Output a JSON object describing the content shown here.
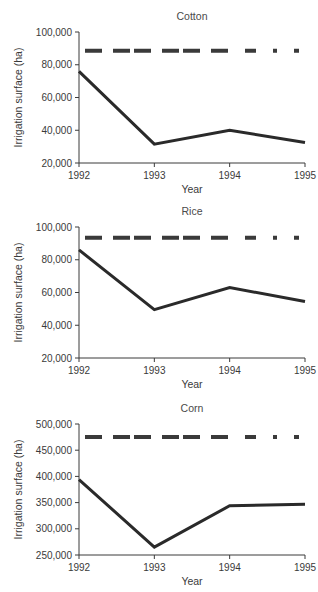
{
  "figure": {
    "background": "#ffffff",
    "line_color": "#2a2a2a",
    "ref_line_color": "#3a3a3a",
    "axis_color": "#3b3b3b"
  },
  "chart_data": [
    {
      "type": "line",
      "title": "Cotton",
      "xlabel": "Year",
      "ylabel": "Irrigation surface (ha)",
      "x": [
        1992,
        1993,
        1994,
        1995
      ],
      "xticklabels": [
        "1992",
        "1993",
        "1994",
        "1995"
      ],
      "xlim": [
        1992,
        1995
      ],
      "values": [
        76000,
        31500,
        40000,
        32500
      ],
      "yticks": [
        20000,
        40000,
        60000,
        80000,
        100000
      ],
      "yticklabels": [
        "20,000",
        "40,000",
        "60,000",
        "80,000",
        "100,000"
      ],
      "ylim": [
        20000,
        100000
      ],
      "grid": false,
      "legend": "none",
      "annotations": [
        {
          "name": "reference-dashed-line",
          "style": "dashed",
          "value": 88500,
          "span": [
            1992,
            1995
          ]
        }
      ]
    },
    {
      "type": "line",
      "title": "Rice",
      "xlabel": "Year",
      "ylabel": "Irrigation surface (ha)",
      "x": [
        1992,
        1993,
        1994,
        1995
      ],
      "xticklabels": [
        "1992",
        "1993",
        "1994",
        "1995"
      ],
      "xlim": [
        1992,
        1995
      ],
      "values": [
        86000,
        49500,
        63000,
        54500
      ],
      "yticks": [
        20000,
        40000,
        60000,
        80000,
        100000
      ],
      "yticklabels": [
        "20,000",
        "40,000",
        "60,000",
        "80,000",
        "100,000"
      ],
      "ylim": [
        20000,
        100000
      ],
      "grid": false,
      "legend": "none",
      "annotations": [
        {
          "name": "reference-dashed-line",
          "style": "dashed",
          "value": 93500,
          "span": [
            1992,
            1995
          ]
        }
      ]
    },
    {
      "type": "line",
      "title": "Corn",
      "xlabel": "Year",
      "ylabel": "Irrigation surface (ha)",
      "x": [
        1992,
        1993,
        1994,
        1995
      ],
      "xticklabels": [
        "1992",
        "1993",
        "1994",
        "1995"
      ],
      "xlim": [
        1992,
        1995
      ],
      "values": [
        394000,
        265000,
        344000,
        347000
      ],
      "yticks": [
        250000,
        300000,
        350000,
        400000,
        450000,
        500000
      ],
      "yticklabels": [
        "250,000",
        "300,000",
        "350,000",
        "400,000",
        "450,000",
        "500,000"
      ],
      "ylim": [
        250000,
        500000
      ],
      "grid": false,
      "legend": "none",
      "annotations": [
        {
          "name": "reference-dashed-line",
          "style": "dashed",
          "value": 475000,
          "span": [
            1992,
            1995
          ]
        }
      ]
    }
  ]
}
